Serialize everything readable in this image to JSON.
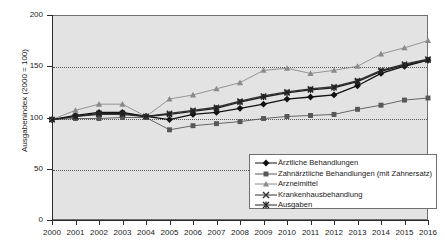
{
  "chart_data": {
    "type": "line",
    "title": "",
    "xlabel": "",
    "ylabel": "Ausgabenindex (2000 = 100)",
    "x": [
      2000,
      2001,
      2002,
      2003,
      2004,
      2005,
      2006,
      2007,
      2008,
      2009,
      2010,
      2011,
      2012,
      2013,
      2014,
      2015,
      2016
    ],
    "xticklabels": [
      "2000",
      "2001",
      "2002",
      "2003",
      "2004",
      "2005",
      "2006",
      "2007",
      "2008",
      "2009",
      "2010",
      "2011",
      "2012",
      "2013",
      "2014",
      "2015",
      "2016"
    ],
    "yticks": [
      0,
      50,
      100,
      150,
      200
    ],
    "yticklabels": [
      "0",
      "50",
      "100",
      "150",
      "200"
    ],
    "ylim": [
      0,
      200
    ],
    "grid": true,
    "legend_position": "lower-right",
    "series": [
      {
        "name": "Ärztliche Behandlungen",
        "marker": "diamond",
        "color": "#111111",
        "values": [
          98,
          102,
          105,
          105,
          101,
          98,
          103,
          105,
          109,
          113,
          118,
          120,
          122,
          131,
          143,
          150,
          156
        ]
      },
      {
        "name": "Zahnärztliche Behandlungen (mit Zahnersatz)",
        "marker": "square",
        "color": "#575757",
        "values": [
          98,
          99,
          99,
          100,
          100,
          88,
          92,
          94,
          96,
          99,
          101,
          102,
          103,
          108,
          112,
          117,
          119
        ]
      },
      {
        "name": "Arzneimittel",
        "marker": "triangle",
        "color": "#8a8a8a",
        "values": [
          98,
          107,
          113,
          113,
          101,
          118,
          122,
          128,
          134,
          146,
          148,
          143,
          146,
          150,
          162,
          168,
          175
        ]
      },
      {
        "name": "Krankenhausbehandlung",
        "marker": "cross",
        "color": "#333333",
        "values": [
          98,
          101,
          103,
          103,
          101,
          104,
          107,
          110,
          116,
          121,
          125,
          128,
          130,
          136,
          146,
          152,
          157
        ]
      },
      {
        "name": "Ausgaben",
        "marker": "asterisk",
        "color": "#222222",
        "values": [
          98,
          101,
          104,
          104,
          101,
          103,
          106,
          109,
          115,
          120,
          124,
          127,
          129,
          135,
          145,
          151,
          156
        ]
      }
    ]
  },
  "legend": {
    "items": [
      {
        "label": "Ärztliche Behandlungen"
      },
      {
        "label": "Zahnärztliche Behandlungen (mit Zahnersatz)"
      },
      {
        "label": "Arzneimittel"
      },
      {
        "label": "Krankenhausbehandlung"
      },
      {
        "label": "Ausgaben"
      }
    ]
  }
}
